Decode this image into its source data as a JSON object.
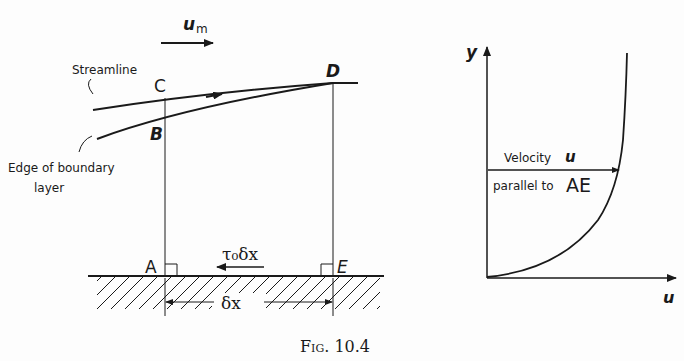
{
  "figure": {
    "caption": "Fig. 10.4",
    "left_diagram": {
      "free_stream_label": "u",
      "free_stream_subscript": "m",
      "streamline_label": "Streamline",
      "boundary_edge_label_line1": "Edge of boundary",
      "boundary_edge_label_line2": "layer",
      "points": {
        "A": "A",
        "B": "B",
        "C": "C",
        "D": "D",
        "E": "E"
      },
      "shear_force_label": "τ₀δx",
      "length_label": "δx"
    },
    "right_diagram": {
      "y_axis_label": "y",
      "x_axis_label": "u",
      "velocity_label": "Velocity",
      "velocity_symbol": "u",
      "parallel_label": "parallel to",
      "parallel_ref": "AE"
    }
  },
  "colors": {
    "ink": "#1a1a1a",
    "background": "#fdfdfd"
  }
}
